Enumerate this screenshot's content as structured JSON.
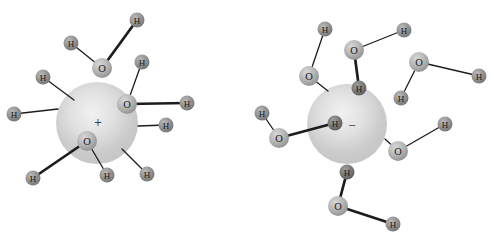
{
  "figure": {
    "width": 493,
    "height": 239,
    "background": "#ffffff",
    "colors": {
      "sphere_stops": [
        "#f1f1f1",
        "#e2e2e2",
        "#cbcbcb",
        "#c2c2c2"
      ],
      "oxygen_stops": [
        "#d8d8d8",
        "#b5b5b5",
        "#878787"
      ],
      "hydrogen_stops": [
        "#b9b9b9",
        "#939393",
        "#6c6c6c"
      ],
      "hydrogen_dark_stops": [
        "#9d9d9d",
        "#7a7a7a",
        "#545454"
      ],
      "bond": "#1c1c1c",
      "label": "#1a1a1a",
      "charge_symbol": "#222222"
    },
    "bond_widths": {
      "thin": 1.3,
      "bold": 2.7
    },
    "ions": [
      {
        "id": "cation",
        "charge_symbol": "+",
        "cx": 97,
        "cy": 123,
        "r": 41,
        "sx": 98,
        "sy": 122,
        "symbol_size": 14
      },
      {
        "id": "anion",
        "charge_symbol": "−",
        "cx": 347,
        "cy": 124,
        "r": 40,
        "sx": 352,
        "sy": 125,
        "symbol_size": 13
      }
    ],
    "atoms": {
      "oxygen_label": "O",
      "hydrogen_label": "H",
      "oxygen_radius": 10,
      "hydrogen_radius": 7.5,
      "oxygen_font_size": 10.5,
      "hydrogen_font_size": 9,
      "oxygens": [
        [
          102,
          68
        ],
        [
          127,
          104
        ],
        [
          87,
          141
        ],
        [
          309,
          76
        ],
        [
          354,
          50
        ],
        [
          419,
          62
        ],
        [
          279,
          138
        ],
        [
          398,
          151
        ],
        [
          338,
          206
        ]
      ],
      "hydrogens": [
        [
          71,
          43,
          0
        ],
        [
          137,
          20,
          0
        ],
        [
          142,
          62,
          0
        ],
        [
          187,
          103,
          0
        ],
        [
          33,
          178,
          0
        ],
        [
          107,
          175,
          0
        ],
        [
          43,
          77,
          0
        ],
        [
          14,
          114,
          0
        ],
        [
          166,
          125,
          0
        ],
        [
          147,
          174,
          0
        ],
        [
          325,
          29,
          0
        ],
        [
          404,
          30,
          0
        ],
        [
          479,
          76,
          0
        ],
        [
          401,
          98,
          0
        ],
        [
          262,
          113,
          0
        ],
        [
          445,
          124,
          0
        ],
        [
          393,
          224,
          0
        ],
        [
          359,
          88,
          1
        ],
        [
          335,
          123,
          1
        ],
        [
          347,
          172,
          1
        ]
      ]
    },
    "bonds": [
      [
        102,
        68,
        71,
        43,
        0
      ],
      [
        102,
        68,
        137,
        20,
        1
      ],
      [
        127,
        104,
        142,
        62,
        0
      ],
      [
        127,
        104,
        187,
        103,
        1
      ],
      [
        87,
        141,
        33,
        178,
        1
      ],
      [
        87,
        141,
        107,
        175,
        0
      ],
      [
        43,
        77,
        74,
        100,
        0
      ],
      [
        14,
        114,
        58,
        109,
        0
      ],
      [
        166,
        125,
        138,
        126,
        0
      ],
      [
        147,
        174,
        122,
        149,
        0
      ],
      [
        309,
        76,
        325,
        29,
        0
      ],
      [
        309,
        76,
        328,
        91,
        0
      ],
      [
        354,
        50,
        404,
        30,
        0
      ],
      [
        354,
        50,
        359,
        88,
        1
      ],
      [
        419,
        62,
        479,
        76,
        0
      ],
      [
        419,
        62,
        401,
        98,
        0
      ],
      [
        279,
        138,
        262,
        113,
        0
      ],
      [
        279,
        138,
        335,
        123,
        1
      ],
      [
        398,
        151,
        385,
        139,
        0
      ],
      [
        398,
        151,
        445,
        124,
        0
      ],
      [
        338,
        206,
        347,
        172,
        1
      ],
      [
        338,
        206,
        393,
        224,
        1
      ]
    ]
  }
}
